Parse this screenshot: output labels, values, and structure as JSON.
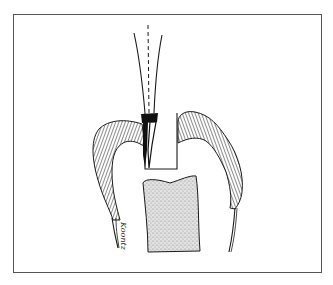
{
  "figure": {
    "colors": {
      "line": "#1a1a1a",
      "stipple": "#b8b8b8",
      "background": "#ffffff",
      "frame": "#555555"
    },
    "elements": [
      "frame-border",
      "bur-shank",
      "bur-center-axis",
      "bur-head",
      "cavity-preparation",
      "enamel-left",
      "enamel-right",
      "root-outline-left",
      "root-outline-right",
      "pulp-chamber"
    ],
    "signature": "Koontz"
  }
}
